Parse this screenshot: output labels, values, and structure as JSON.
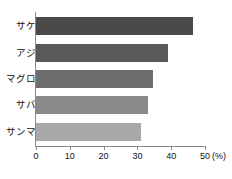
{
  "chart_data": {
    "type": "bar",
    "orientation": "horizontal",
    "title": "",
    "xlabel": "(%)",
    "ylabel": "",
    "categories": [
      "サケ",
      "アジ",
      "マグロ",
      "サバ",
      "サンマ"
    ],
    "values": [
      46.5,
      39,
      34.5,
      33,
      31
    ],
    "series": [
      {
        "name": "",
        "values": [
          46.5,
          39,
          34.5,
          33,
          31
        ]
      }
    ],
    "xlim": [
      0,
      50
    ],
    "xticks": [
      0,
      10,
      20,
      30,
      40,
      50
    ],
    "xtick_labels": [
      "0",
      "10",
      "20",
      "30",
      "40",
      "50"
    ],
    "unit_label": "(%)",
    "grid": false,
    "legend": false,
    "bar_colors": [
      "#4a4a4a",
      "#595959",
      "#6e6e6e",
      "#8a8a8a",
      "#a9a9a9"
    ],
    "axis_color": "#8a8a8a",
    "background": "#ffffff"
  }
}
